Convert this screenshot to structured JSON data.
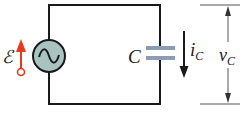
{
  "diagram": {
    "type": "ac-capacitor-circuit",
    "source": {
      "label": "ℰ",
      "symbol": "~",
      "fill": "#a9c4c0",
      "arrow_color": "#e8391f"
    },
    "capacitor": {
      "label": "C",
      "plate_color": "#8c9cb4"
    },
    "current": {
      "label": "i",
      "subscript": "C"
    },
    "voltage": {
      "label": "v",
      "subscript": "C"
    },
    "wire_color": "#1a1a1a"
  }
}
